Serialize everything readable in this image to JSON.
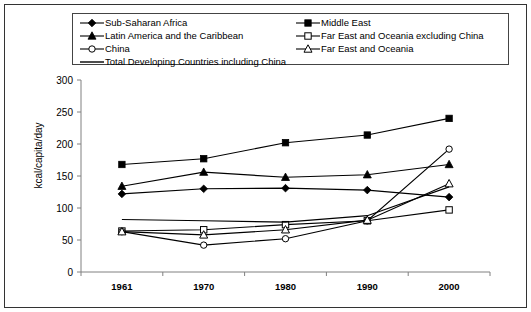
{
  "chart_data": {
    "type": "line",
    "title": "",
    "xlabel": "",
    "ylabel": "kcal/capita/day",
    "x": [
      1961,
      1970,
      1980,
      1990,
      2000
    ],
    "xtick_labels": [
      "1961",
      "1970",
      "1980",
      "1990",
      "2000"
    ],
    "ytick_labels": [
      "0",
      "50",
      "100",
      "150",
      "200",
      "250",
      "300"
    ],
    "ytick_values": [
      0,
      50,
      100,
      150,
      200,
      250,
      300
    ],
    "ylim": [
      0,
      300
    ],
    "grid": false,
    "legend_position": "top",
    "series": [
      {
        "name": "Sub-Saharan Africa",
        "marker": "filled-diamond",
        "values": [
          122,
          130,
          131,
          128,
          117
        ]
      },
      {
        "name": "Middle East",
        "marker": "filled-square",
        "values": [
          168,
          177,
          202,
          214,
          240
        ]
      },
      {
        "name": "Latin America and the Caribbean",
        "marker": "filled-triangle",
        "values": [
          134,
          156,
          148,
          152,
          168
        ]
      },
      {
        "name": "Far East and Oceania excluding China",
        "marker": "open-square",
        "values": [
          64,
          66,
          74,
          80,
          97
        ]
      },
      {
        "name": "China",
        "marker": "open-circle",
        "values": [
          63,
          42,
          52,
          80,
          192
        ]
      },
      {
        "name": "Far East and Oceania",
        "marker": "open-triangle",
        "values": [
          63,
          58,
          66,
          81,
          138
        ]
      },
      {
        "name": "Total Developing Countries including China",
        "marker": "none",
        "values": [
          82,
          80,
          78,
          88,
          133
        ]
      }
    ]
  },
  "legend": {
    "left_column": [
      {
        "label": "Sub-Saharan Africa",
        "marker": "filled-diamond"
      },
      {
        "label": "Latin America and the Caribbean",
        "marker": "filled-triangle"
      },
      {
        "label": "China",
        "marker": "open-circle"
      },
      {
        "label": "Total Developing Countries including China",
        "marker": "none"
      }
    ],
    "right_column": [
      {
        "label": "Middle East",
        "marker": "filled-square"
      },
      {
        "label": "Far East and Oceania excluding China",
        "marker": "open-square"
      },
      {
        "label": "Far East and Oceania",
        "marker": "open-triangle"
      }
    ]
  },
  "colors": {
    "line": "#000000",
    "axis": "#808080",
    "border": "#333333",
    "background": "#ffffff"
  }
}
